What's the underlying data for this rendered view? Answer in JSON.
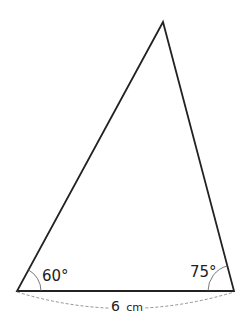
{
  "diagram": {
    "type": "triangle",
    "vertices": {
      "apex": [
        163,
        22
      ],
      "bottom_left": [
        17,
        291
      ],
      "bottom_right": [
        234,
        291
      ]
    },
    "angles": {
      "bottom_left": "60°",
      "bottom_right": "75°"
    },
    "base_length": "6",
    "base_unit": "cm",
    "colors": {
      "stroke": "#222222",
      "dashed": "#888888"
    }
  }
}
